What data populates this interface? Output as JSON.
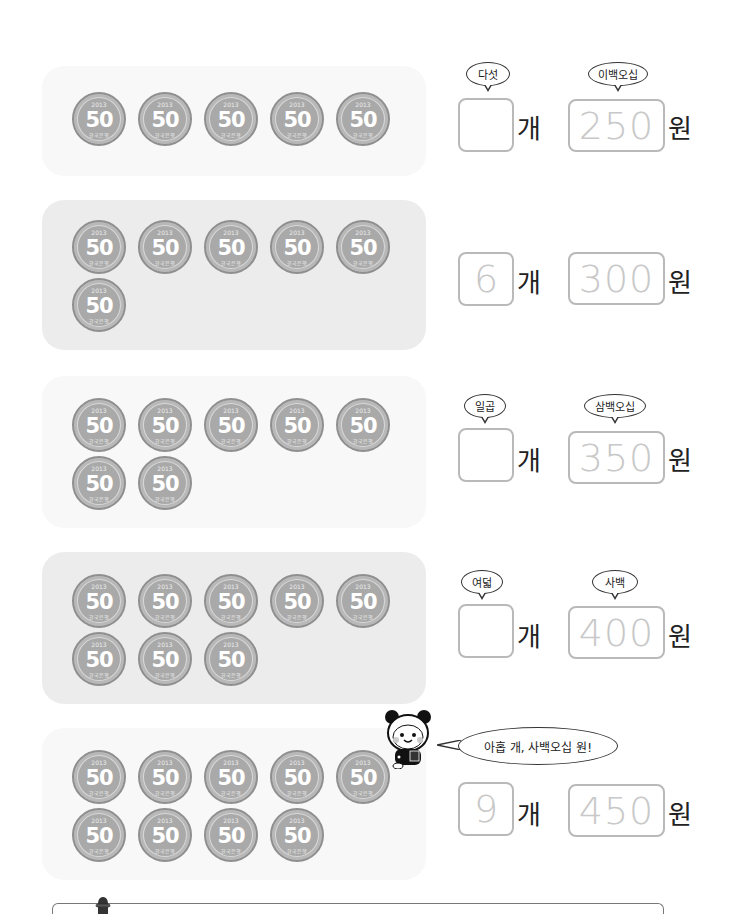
{
  "coin": {
    "value": "50",
    "year": "2013",
    "issuer": "한국은행"
  },
  "units": {
    "count": "개",
    "won": "원"
  },
  "exercises": [
    {
      "coin_count": 5,
      "count_hint": "다섯",
      "count_answer": "",
      "amount_hint": "이백오십",
      "amount": "250"
    },
    {
      "coin_count": 6,
      "count_hint": "",
      "count_answer": "6",
      "amount_hint": "",
      "amount": "300"
    },
    {
      "coin_count": 7,
      "count_hint": "일곱",
      "count_answer": "",
      "amount_hint": "삼백오십",
      "amount": "350"
    },
    {
      "coin_count": 8,
      "count_hint": "여덟",
      "count_answer": "",
      "amount_hint": "사백",
      "amount": "400"
    },
    {
      "coin_count": 9,
      "count_hint": "",
      "count_answer": "9",
      "amount_hint": "",
      "amount": "450"
    }
  ],
  "mascot": {
    "speech": "아홉 개, 사백오십 원!"
  },
  "colors": {
    "panel_light": "#f8f8f8",
    "panel_dark": "#ececec",
    "coin": "#a9a9a9",
    "box_border": "#b9b9b9",
    "trace_text": "#c8c8c8"
  }
}
